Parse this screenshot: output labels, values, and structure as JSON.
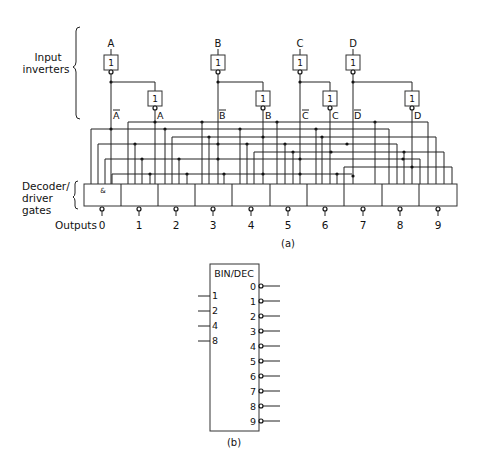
{
  "figure_a": {
    "caption": "(a)",
    "section_labels": {
      "input_inverters": [
        "Input",
        "inverters"
      ],
      "decoder_gates": [
        "Decoder/",
        "driver",
        "gates"
      ],
      "outputs": "Outputs"
    },
    "inputs": [
      "A",
      "B",
      "C",
      "D"
    ],
    "inverter_symbol": "1",
    "and_symbol": "&",
    "signal_labels": {
      "A_bar": "A",
      "A": "A",
      "B_bar": "B",
      "B": "B",
      "C_bar": "C",
      "C": "C",
      "D_bar": "D",
      "D": "D"
    },
    "outputs": [
      "0",
      "1",
      "2",
      "3",
      "4",
      "5",
      "6",
      "7",
      "8",
      "9"
    ]
  },
  "figure_b": {
    "caption": "(b)",
    "title": "BIN/DEC",
    "inputs": [
      "1",
      "2",
      "4",
      "8"
    ],
    "outputs": [
      "0",
      "1",
      "2",
      "3",
      "4",
      "5",
      "6",
      "7",
      "8",
      "9"
    ]
  }
}
